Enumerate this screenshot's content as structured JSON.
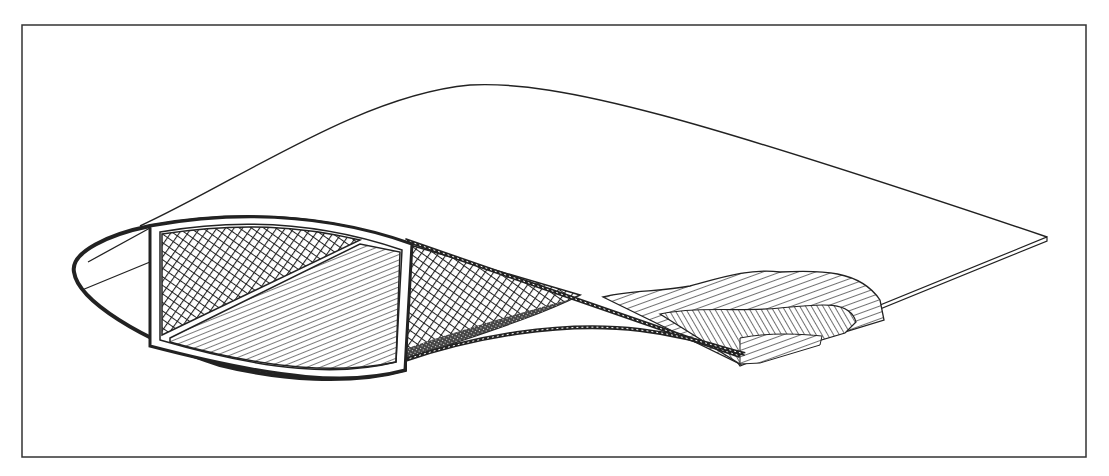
{
  "figure": {
    "type": "technical-illustration",
    "frame": {
      "x": 22,
      "y": 25,
      "width": 1064,
      "height": 432,
      "stroke": "#333333"
    },
    "colors": {
      "line": "#222222",
      "background": "#ffffff",
      "fill_dense": "#333333"
    },
    "components": [
      {
        "id": "outer-skin",
        "label": ""
      },
      {
        "id": "leading-edge-cell",
        "label": ""
      },
      {
        "id": "spar-box",
        "label": ""
      },
      {
        "id": "spar-crosshatch-core",
        "label": ""
      },
      {
        "id": "spar-diagonal-hatch",
        "label": ""
      },
      {
        "id": "aft-crosshatch-core",
        "label": ""
      },
      {
        "id": "trailing-edge-layup",
        "label": ""
      },
      {
        "id": "upper-planform-outline",
        "label": ""
      }
    ],
    "text_labels": []
  }
}
